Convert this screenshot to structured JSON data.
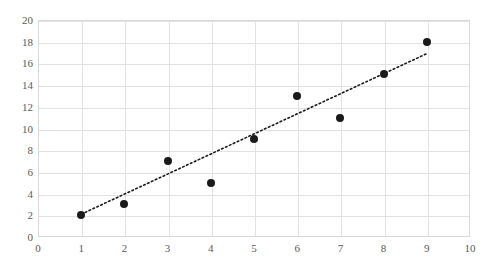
{
  "ghost": {
    "top_line": "",
    "bottom_line": "",
    "caption": ""
  },
  "chart_data": {
    "type": "scatter",
    "title": "",
    "xlabel": "",
    "ylabel": "",
    "xlim": [
      0,
      10
    ],
    "ylim": [
      0,
      20
    ],
    "xticks": [
      0,
      1,
      2,
      3,
      4,
      5,
      6,
      7,
      8,
      9,
      10
    ],
    "yticks": [
      0,
      2,
      4,
      6,
      8,
      10,
      12,
      14,
      16,
      18,
      20
    ],
    "grid": "both",
    "legend": "none",
    "series": [
      {
        "name": "data-points",
        "marker": "filled-circle",
        "color": "#1a1a1a",
        "points": [
          {
            "x": 1,
            "y": 2
          },
          {
            "x": 2,
            "y": 3
          },
          {
            "x": 3,
            "y": 7
          },
          {
            "x": 4,
            "y": 5
          },
          {
            "x": 5,
            "y": 9
          },
          {
            "x": 6,
            "y": 13
          },
          {
            "x": 7,
            "y": 11
          },
          {
            "x": 8,
            "y": 15
          },
          {
            "x": 9,
            "y": 18
          }
        ]
      },
      {
        "name": "linear-trendline",
        "marker": "none",
        "style": "dotted",
        "color": "#1a1a1a",
        "points": [
          {
            "x": 1,
            "y": 2.1
          },
          {
            "x": 9,
            "y": 16.9
          }
        ]
      }
    ]
  },
  "colors": {
    "plot_border": "#d9d9d9",
    "gridline": "#e2e2e2",
    "marker": "#1a1a1a",
    "tick_text": "#5a5a5a",
    "background": "#ffffff"
  }
}
